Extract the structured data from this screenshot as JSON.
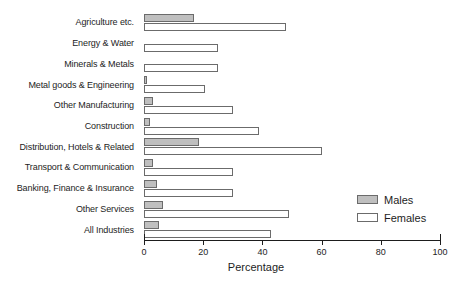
{
  "chart_data": {
    "type": "bar",
    "orientation": "horizontal",
    "title": "",
    "xlabel": "Percentage",
    "ylabel": "",
    "xlim": [
      0,
      100
    ],
    "xticks": [
      0,
      20,
      40,
      60,
      80,
      100
    ],
    "xtick_labels": [
      "0",
      "20",
      "40",
      "60",
      "80",
      "100"
    ],
    "grid": false,
    "legend_position": "bottom-right",
    "categories": [
      "Agriculture etc.",
      "Energy & Water",
      "Minerals & Metals",
      "Metal goods & Engineering",
      "Other Manufacturing",
      "Construction",
      "Distribution, Hotels & Related",
      "Transport & Communication",
      "Banking, Finance & Insurance",
      "Other Services",
      "All Industries"
    ],
    "series": [
      {
        "name": "Males",
        "color": "#bfbfbf",
        "values": [
          17,
          0,
          0,
          1,
          3,
          2,
          18.5,
          3,
          4.5,
          6.5,
          5
        ]
      },
      {
        "name": "Females",
        "color": "#ffffff",
        "values": [
          48,
          25,
          25,
          20.5,
          30,
          39,
          60,
          30,
          30,
          49,
          43
        ]
      }
    ]
  },
  "legend": {
    "items": [
      {
        "label": "Males",
        "swatch": "males"
      },
      {
        "label": "Females",
        "swatch": "females"
      }
    ]
  },
  "axis": {
    "title": "Percentage"
  },
  "colors": {
    "male_fill": "#bfbfbf",
    "female_fill": "#ffffff",
    "bar_border": "#6b6b6b",
    "axis": "#1d1d1d",
    "background": "#ffffff"
  }
}
